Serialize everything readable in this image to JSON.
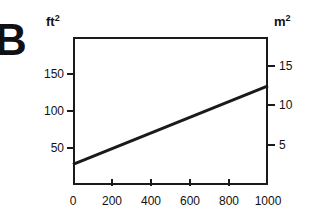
{
  "figure": {
    "panel_label": "B"
  },
  "axes": {
    "left": {
      "unit_base": "ft",
      "unit_exponent": "2",
      "ticks": [
        {
          "label": "150",
          "value": 150
        },
        {
          "label": "100",
          "value": 100
        },
        {
          "label": "50",
          "value": 50
        }
      ],
      "range": [
        0,
        200
      ]
    },
    "right": {
      "unit_base": "m",
      "unit_exponent": "2",
      "ticks": [
        {
          "label": "15",
          "value": 15
        },
        {
          "label": "10",
          "value": 10
        },
        {
          "label": "5",
          "value": 5
        }
      ],
      "range": [
        0,
        18.58
      ]
    },
    "bottom": {
      "ticks": [
        {
          "label": "0",
          "value": 0
        },
        {
          "label": "200",
          "value": 200
        },
        {
          "label": "400",
          "value": 400
        },
        {
          "label": "600",
          "value": 600
        },
        {
          "label": "800",
          "value": 800
        },
        {
          "label": "1000",
          "value": 1000
        }
      ],
      "range": [
        0,
        1000
      ]
    }
  },
  "style": {
    "line_color": "#1a1a1a",
    "frame_color": "#1a1a1a",
    "text_color": "#111111",
    "background": "#ffffff",
    "line_width": 3,
    "frame_width": 2
  },
  "chart_data": {
    "type": "line",
    "title": "",
    "subtitle": "",
    "xlabel": "",
    "ylabel": "ft²",
    "y2label": "m²",
    "xlim": [
      0,
      1000
    ],
    "ylim": [
      0,
      200
    ],
    "y2lim": [
      0,
      18.58
    ],
    "grid": false,
    "legend": "none",
    "annotations": [
      "B"
    ],
    "xticks": [
      0,
      200,
      400,
      600,
      800,
      1000
    ],
    "yticks": [
      50,
      100,
      150
    ],
    "y2ticks": [
      5,
      10,
      15
    ],
    "series": [
      {
        "name": "area",
        "x": [
          0,
          1000
        ],
        "values": [
          28,
          134
        ]
      }
    ]
  }
}
